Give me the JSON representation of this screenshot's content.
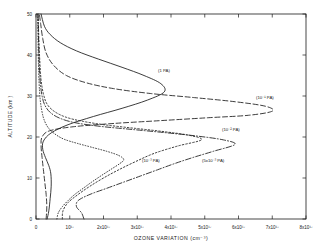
{
  "figure": {
    "title": "",
    "background_color": "#ffffff",
    "line_color": "#1a1a1a"
  },
  "axes": {
    "x_label": "OZONE VARIATION (cm⁻³)",
    "y_label": "ALTITUDE (km )",
    "x_tick_labels": [
      "0",
      "10¹⁷",
      "2x10¹⁷",
      "3x10¹⁷",
      "4x10¹⁷",
      "5x10¹⁷",
      "6x10¹⁷",
      "7x10¹⁷",
      "8x10¹⁷"
    ],
    "y_tick_labels": [
      "0",
      "10",
      "20",
      "30",
      "40",
      "50"
    ]
  },
  "curve_labels": [
    {
      "id": "label-1pa",
      "text": "(1 PA)",
      "x": 158,
      "y": 72
    },
    {
      "id": "label-1e-1pa",
      "text": "(10⁻¹ PA)",
      "x": 256,
      "y": 99
    },
    {
      "id": "label-1e-2pa",
      "text": "(10⁻² PA)",
      "x": 222,
      "y": 131
    },
    {
      "id": "label-1e-3pa",
      "text": "(10⁻³ PA)",
      "x": 142,
      "y": 162
    },
    {
      "id": "label-5e-3pa",
      "text": "(5x10⁻³ PA)",
      "x": 202,
      "y": 162
    }
  ],
  "chart_data": {
    "type": "line",
    "title": "",
    "xlabel": "OZONE VARIATION (cm^-3)",
    "ylabel": "ALTITUDE (km)",
    "xlim": [
      0,
      8e+17
    ],
    "ylim": [
      0,
      50
    ],
    "xticks": [
      0,
      1e+17,
      2e+17,
      3e+17,
      4e+17,
      5e+17,
      6e+17,
      7e+17,
      8e+17
    ],
    "yticks": [
      0,
      10,
      20,
      30,
      40,
      50
    ],
    "grid": false,
    "legend": "inline annotations next to each curve",
    "x_units": "cm^-3",
    "y_units": "km",
    "series": [
      {
        "name": "(1 PA)",
        "linestyle": "solid",
        "peak_x": 3.8e+17,
        "peak_y": 31,
        "points": [
          {
            "x": 3.3e+16,
            "y": 0
          },
          {
            "x": 3.8e+16,
            "y": 2
          },
          {
            "x": 4.2e+16,
            "y": 5
          },
          {
            "x": 4.5e+16,
            "y": 8
          },
          {
            "x": 4.4e+16,
            "y": 11
          },
          {
            "x": 3.8e+16,
            "y": 13
          },
          {
            "x": 2.8e+16,
            "y": 15
          },
          {
            "x": 2e+16,
            "y": 17
          },
          {
            "x": 2.2e+16,
            "y": 19
          },
          {
            "x": 4.5e+16,
            "y": 21
          },
          {
            "x": 9.5e+16,
            "y": 23
          },
          {
            "x": 1.7e+17,
            "y": 25
          },
          {
            "x": 2.55e+17,
            "y": 27
          },
          {
            "x": 3.3e+17,
            "y": 29
          },
          {
            "x": 3.8e+17,
            "y": 31
          },
          {
            "x": 3.7e+17,
            "y": 33
          },
          {
            "x": 3.2e+17,
            "y": 35
          },
          {
            "x": 2.55e+17,
            "y": 37
          },
          {
            "x": 1.85e+17,
            "y": 39
          },
          {
            "x": 1.2e+17,
            "y": 41
          },
          {
            "x": 7.2e+16,
            "y": 43
          },
          {
            "x": 4.2e+16,
            "y": 45
          },
          {
            "x": 2.5e+16,
            "y": 47
          },
          {
            "x": 1.5e+16,
            "y": 50
          }
        ]
      },
      {
        "name": "(10^-1 PA)",
        "linestyle": "dashed",
        "peak_x": 7e+17,
        "peak_y": 26,
        "points": [
          {
            "x": 3e+16,
            "y": 0
          },
          {
            "x": 3.2e+16,
            "y": 3
          },
          {
            "x": 3e+16,
            "y": 6
          },
          {
            "x": 2.6e+16,
            "y": 9
          },
          {
            "x": 2.2e+16,
            "y": 12
          },
          {
            "x": 1.8e+16,
            "y": 15
          },
          {
            "x": 1.5e+16,
            "y": 18
          },
          {
            "x": 1.8e+16,
            "y": 20
          },
          {
            "x": 4e+16,
            "y": 21.5
          },
          {
            "x": 1.1e+17,
            "y": 22.5
          },
          {
            "x": 2.3e+17,
            "y": 23.3
          },
          {
            "x": 3.7e+17,
            "y": 24.0
          },
          {
            "x": 5.1e+17,
            "y": 24.7
          },
          {
            "x": 6.3e+17,
            "y": 25.3
          },
          {
            "x": 7e+17,
            "y": 26.3
          },
          {
            "x": 6.8e+17,
            "y": 27.5
          },
          {
            "x": 5.9e+17,
            "y": 28.6
          },
          {
            "x": 4.7e+17,
            "y": 29.6
          },
          {
            "x": 3.4e+17,
            "y": 30.6
          },
          {
            "x": 2.3e+17,
            "y": 31.8
          },
          {
            "x": 1.5e+17,
            "y": 33.2
          },
          {
            "x": 9e+16,
            "y": 35.0
          },
          {
            "x": 5.2e+16,
            "y": 37.5
          },
          {
            "x": 3e+16,
            "y": 40.5
          },
          {
            "x": 2e+16,
            "y": 44.0
          },
          {
            "x": 1.4e+16,
            "y": 47.5
          },
          {
            "x": 1e+16,
            "y": 50
          }
        ]
      },
      {
        "name": "(10^-2 PA)",
        "linestyle": "dashdot",
        "peak_x": 5.9e+17,
        "peak_y": 18,
        "points": [
          {
            "x": 1.42e+17,
            "y": 0
          },
          {
            "x": 1.35e+17,
            "y": 1.5
          },
          {
            "x": 1.2e+17,
            "y": 3
          },
          {
            "x": 1.25e+17,
            "y": 4.5
          },
          {
            "x": 1.6e+17,
            "y": 6
          },
          {
            "x": 2.1e+17,
            "y": 7.5
          },
          {
            "x": 2.6e+17,
            "y": 9
          },
          {
            "x": 3.1e+17,
            "y": 10.5
          },
          {
            "x": 3.6e+17,
            "y": 12
          },
          {
            "x": 4.1e+17,
            "y": 13.5
          },
          {
            "x": 4.65e+17,
            "y": 15
          },
          {
            "x": 5.25e+17,
            "y": 16.5
          },
          {
            "x": 5.9e+17,
            "y": 18.2
          },
          {
            "x": 5.55e+17,
            "y": 19.3
          },
          {
            "x": 4.8e+17,
            "y": 20.2
          },
          {
            "x": 3.9e+17,
            "y": 21.0
          },
          {
            "x": 2.9e+17,
            "y": 21.8
          },
          {
            "x": 1.9e+17,
            "y": 22.6
          },
          {
            "x": 1.15e+17,
            "y": 23.5
          },
          {
            "x": 7e+16,
            "y": 24.6
          },
          {
            "x": 4.2e+16,
            "y": 26.0
          },
          {
            "x": 2.6e+16,
            "y": 27.8
          },
          {
            "x": 1.8e+16,
            "y": 30.0
          },
          {
            "x": 1.3e+16,
            "y": 33.0
          },
          {
            "x": 1e+16,
            "y": 37.0
          },
          {
            "x": 8000000000000000.0,
            "y": 42.0
          },
          {
            "x": 6000000000000000.0,
            "y": 50
          }
        ]
      },
      {
        "name": "(10^-3 PA)",
        "linestyle": "dotted",
        "peak_x": 4.9e+17,
        "peak_y": 19,
        "points": [
          {
            "x": 7.8e+16,
            "y": 0
          },
          {
            "x": 8e+16,
            "y": 2
          },
          {
            "x": 9.5e+16,
            "y": 4
          },
          {
            "x": 1.25e+17,
            "y": 6
          },
          {
            "x": 1.6e+17,
            "y": 8
          },
          {
            "x": 2e+17,
            "y": 10
          },
          {
            "x": 2.45e+17,
            "y": 12
          },
          {
            "x": 2.95e+17,
            "y": 14
          },
          {
            "x": 3.5e+17,
            "y": 16
          },
          {
            "x": 4.2e+17,
            "y": 17.8
          },
          {
            "x": 4.9e+17,
            "y": 19.3
          },
          {
            "x": 4.55e+17,
            "y": 20.4
          },
          {
            "x": 3.8e+17,
            "y": 21.3
          },
          {
            "x": 2.95e+17,
            "y": 22.1
          },
          {
            "x": 2.1e+17,
            "y": 22.9
          },
          {
            "x": 1.4e+17,
            "y": 23.8
          },
          {
            "x": 9e+16,
            "y": 24.8
          },
          {
            "x": 5.5e+16,
            "y": 26.2
          },
          {
            "x": 3.3e+16,
            "y": 28.0
          },
          {
            "x": 2.2e+16,
            "y": 30.5
          },
          {
            "x": 1.5e+16,
            "y": 34.0
          },
          {
            "x": 1.1e+16,
            "y": 39.0
          },
          {
            "x": 8000000000000000.0,
            "y": 45.0
          },
          {
            "x": 6000000000000000.0,
            "y": 50
          }
        ]
      },
      {
        "name": "(5x10^-3 PA)",
        "linestyle": "finedotted",
        "peak_x": 2.6e+17,
        "peak_y": 14,
        "points": [
          {
            "x": 6.2e+16,
            "y": 0
          },
          {
            "x": 6.6e+16,
            "y": 1.5
          },
          {
            "x": 7.8e+16,
            "y": 3
          },
          {
            "x": 9.5e+16,
            "y": 4.5
          },
          {
            "x": 1.15e+17,
            "y": 6
          },
          {
            "x": 1.4e+17,
            "y": 7.5
          },
          {
            "x": 1.65e+17,
            "y": 9
          },
          {
            "x": 1.92e+17,
            "y": 10.5
          },
          {
            "x": 2.2e+17,
            "y": 12
          },
          {
            "x": 2.48e+17,
            "y": 13.5
          },
          {
            "x": 2.6e+17,
            "y": 14.5
          },
          {
            "x": 2.45e+17,
            "y": 15.5
          },
          {
            "x": 2.1e+17,
            "y": 16.5
          },
          {
            "x": 1.65e+17,
            "y": 17.5
          },
          {
            "x": 1.2e+17,
            "y": 18.5
          },
          {
            "x": 8.2e+16,
            "y": 19.5
          },
          {
            "x": 5.5e+16,
            "y": 20.8
          },
          {
            "x": 3.6e+16,
            "y": 22.3
          },
          {
            "x": 2.4e+16,
            "y": 24.2
          },
          {
            "x": 1.7e+16,
            "y": 26.5
          },
          {
            "x": 1.2e+16,
            "y": 29.5
          },
          {
            "x": 9000000000000000.0,
            "y": 33.5
          },
          {
            "x": 7000000000000000.0,
            "y": 39.0
          },
          {
            "x": 5000000000000000.0,
            "y": 50
          }
        ]
      }
    ]
  }
}
